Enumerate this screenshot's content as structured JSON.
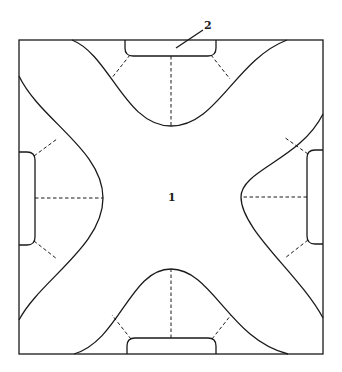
{
  "diagram": {
    "type": "schematic cross-shaped region in square with edge pads",
    "labels": {
      "center": "1",
      "pad": "2"
    },
    "elements": [
      {
        "id": "outer-square",
        "description": "square boundary"
      },
      {
        "id": "central-region",
        "description": "four-armed cross/star shaped region bounded by curves",
        "label": "1"
      },
      {
        "id": "top-pad",
        "description": "rounded pad on top edge",
        "label": "2"
      },
      {
        "id": "bottom-pad",
        "description": "rounded pad on bottom edge"
      },
      {
        "id": "left-pad",
        "description": "rounded pad on left edge"
      },
      {
        "id": "right-pad",
        "description": "rounded pad on right edge"
      },
      {
        "id": "dashed-connectors",
        "description": "dashed lines radiating from each pad to the curved boundary"
      }
    ],
    "colors": {
      "line": "#1a1a1a",
      "background": "#ffffff"
    }
  }
}
